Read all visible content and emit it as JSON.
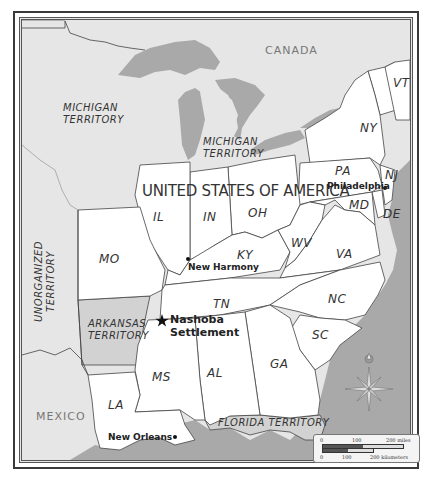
{
  "map": {
    "title": "United States of America",
    "colors": {
      "land_us": "#ffffff",
      "land_foreign": "#e6e6e6",
      "territory_shaded": "#d2d2d2",
      "water": "#a9a9a9",
      "border": "#444444"
    },
    "countries": [
      {
        "id": "canada",
        "label": "CANADA"
      },
      {
        "id": "mexico",
        "label": "MEXICO"
      },
      {
        "id": "usa",
        "label": "UNITED STATES OF AMERICA"
      }
    ],
    "territories": [
      {
        "id": "michigan-territory-west",
        "line1": "MICHIGAN",
        "line2": "TERRITORY"
      },
      {
        "id": "michigan-territory-east",
        "line1": "MICHIGAN",
        "line2": "TERRITORY"
      },
      {
        "id": "unorganized-territory",
        "line1": "UNORGANIZED",
        "line2": "TERRITORY"
      },
      {
        "id": "arkansas-territory",
        "line1": "ARKANSAS",
        "line2": "TERRITORY"
      },
      {
        "id": "florida-territory",
        "line1": "FLORIDA TERRITORY"
      }
    ],
    "states": [
      "VT",
      "NY",
      "PA",
      "NJ",
      "MD",
      "DE",
      "IL",
      "IN",
      "OH",
      "WV",
      "VA",
      "KY",
      "MO",
      "TN",
      "NC",
      "SC",
      "GA",
      "AL",
      "MS",
      "LA"
    ],
    "cities": [
      {
        "id": "philadelphia",
        "label": "Philadelphia",
        "marker": "dot"
      },
      {
        "id": "new-harmony",
        "label": "New Harmony",
        "marker": "dot"
      },
      {
        "id": "nashoba",
        "line1": "Nashoba",
        "line2": "Settlement",
        "marker": "star"
      },
      {
        "id": "new-orleans",
        "label": "New Orleans",
        "marker": "dot"
      }
    ],
    "compass": {
      "icon": "compass-rose-icon"
    },
    "scale_bar": {
      "miles_labels": [
        "0",
        "100",
        "200 miles"
      ],
      "km_labels": [
        "0",
        "100",
        "200 kilometers"
      ]
    }
  }
}
